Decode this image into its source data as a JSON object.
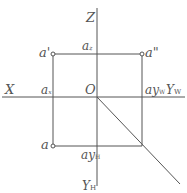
{
  "diagram": {
    "colors": {
      "line": "#555555",
      "text": "#555555",
      "background": "#ffffff"
    },
    "axes": {
      "z": "Z",
      "x": "X",
      "origin": "O",
      "yw": "Y",
      "yw_sub": "W",
      "yh": "Y",
      "yh_sub": "H"
    },
    "points": {
      "front": {
        "label": "a",
        "prime": "'"
      },
      "side": {
        "label": "a",
        "prime": "\""
      },
      "top": {
        "label": "a"
      },
      "az": {
        "label": "a",
        "sub": "z"
      },
      "ax": {
        "label": "a",
        "sub": "x"
      },
      "ayw": {
        "label": "ay",
        "sub": "W"
      },
      "ayh": {
        "label": "ay",
        "sub": "H"
      }
    }
  }
}
